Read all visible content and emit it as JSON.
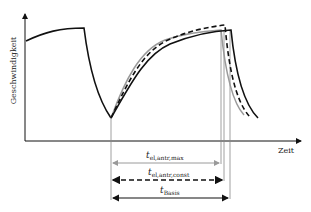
{
  "axes": {
    "y_label": "Geschwindigkeit",
    "x_label": "Zeit"
  },
  "time_spans": [
    {
      "symbol": "t",
      "subscript": "el,antr,max",
      "line_style": "solid-gray"
    },
    {
      "symbol": "t",
      "subscript": "el,antr,const",
      "line_style": "dashed-black"
    },
    {
      "symbol": "t",
      "subscript": "Basis",
      "line_style": "solid-black"
    }
  ],
  "curves": [
    {
      "name": "Basis",
      "style": "solid-black"
    },
    {
      "name": "el,antr,const",
      "style": "dashed-black"
    },
    {
      "name": "el,antr,max",
      "style": "solid-gray"
    }
  ],
  "colors": {
    "black": "#111111",
    "gray": "#9a9a9a"
  }
}
